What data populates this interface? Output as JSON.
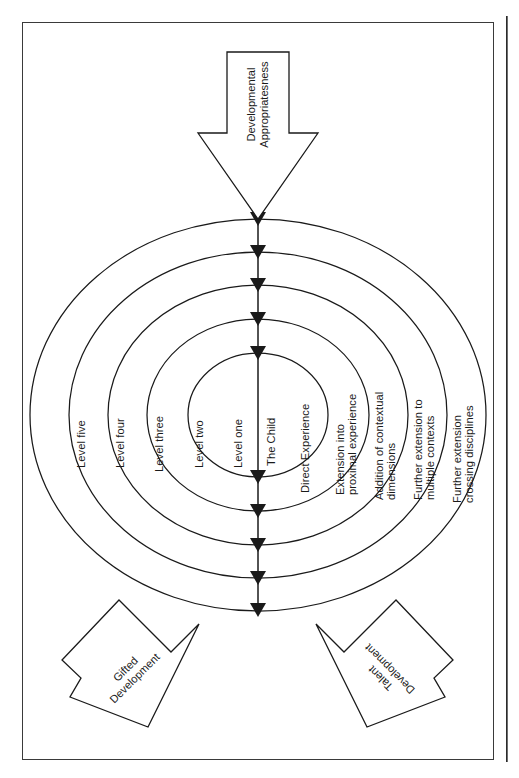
{
  "figure": {
    "type": "concentric-rings-diagram",
    "orientation": "rotated-90-clockwise",
    "center_label": "The Child",
    "axis_label": "The Child"
  },
  "rings": [
    {
      "index": 1,
      "level_label": "Level one",
      "description": "Direct Experience"
    },
    {
      "index": 2,
      "level_label": "Level two",
      "description": "Extension into proximal experience"
    },
    {
      "index": 3,
      "level_label": "Level three",
      "description": "Addition of contextual dimensions"
    },
    {
      "index": 4,
      "level_label": "Level four",
      "description": "Further extension to multiple contexts"
    },
    {
      "index": 5,
      "level_label": "Level five",
      "description": "Further extension crossing disciplines"
    }
  ],
  "ring_descriptions": {
    "one_l1": "Direct Experience",
    "two_l1": "Extension into",
    "two_l2": "proximal experience",
    "three_l1": "Addition of contextual",
    "three_l2": "dimensions",
    "four_l1": "Further extension to",
    "four_l2": "multiple contexts",
    "five_l1": "Further extension",
    "five_l2": "crossing disciplines"
  },
  "arrows": [
    {
      "id": "developmental-appropriateness",
      "line1": "Developmental",
      "line2": "Appropriatesness",
      "position": "top"
    },
    {
      "id": "gifted-development",
      "line1": "Gifted",
      "line2": "Development",
      "position": "bottom-left"
    },
    {
      "id": "talent-development",
      "line1": "Talent",
      "line2": "Development",
      "position": "bottom-right"
    }
  ],
  "colors": {
    "stroke": "#1a1a1a",
    "frame": "#3a3a3a",
    "background": "#ffffff",
    "text": "#1a1a1a"
  }
}
